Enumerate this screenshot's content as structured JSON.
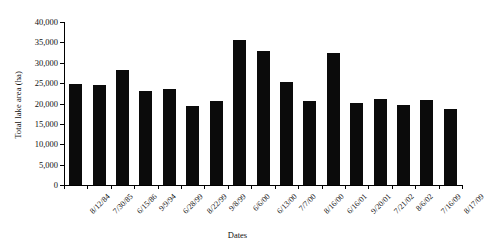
{
  "chart_data": {
    "type": "bar",
    "title": "",
    "xlabel": "Dates",
    "ylabel": "Total lake area (ha)",
    "ylim": [
      0,
      40000
    ],
    "ytick_values": [
      0,
      5000,
      10000,
      15000,
      20000,
      25000,
      30000,
      35000,
      40000
    ],
    "ytick_labels": [
      "0",
      "5,000",
      "10,000",
      "15,000",
      "20,000",
      "25,000",
      "30,000",
      "35,000",
      "40,000"
    ],
    "grid": false,
    "legend": null,
    "bar_color": "#0b0b0b",
    "categories": [
      "8/12/84",
      "7/30/85",
      "6/15/86",
      "9/9/94",
      "6/28/99",
      "8/22/99",
      "9/8/99",
      "6/6/00",
      "6/13/00",
      "7/7/00",
      "8/16/00",
      "6/16/01",
      "9/20/01",
      "7/21/02",
      "8/6/02",
      "7/16/09",
      "8/17/09"
    ],
    "values": [
      24800,
      24500,
      28300,
      23000,
      23600,
      19400,
      20700,
      35500,
      32800,
      25400,
      20500,
      32300,
      20200,
      21200,
      19700,
      20800,
      18600
    ],
    "axis_tick_labels_rotated_deg": 45
  }
}
